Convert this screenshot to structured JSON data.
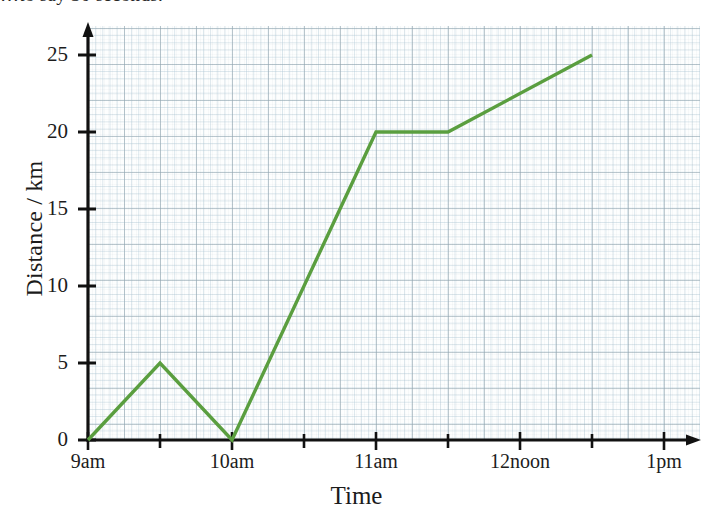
{
  "top_text": "…to say 30 seconds.",
  "chart_data": {
    "type": "line",
    "title": "",
    "xlabel": "Time",
    "ylabel": "Distance / km",
    "grid": true,
    "legend": "none",
    "line_color": "#5a9e3f",
    "axis_color": "#111111",
    "x_tick_labels": [
      "9am",
      "10am",
      "11am",
      "12noon",
      "1pm"
    ],
    "x_tick_values": [
      9,
      10,
      11,
      12,
      13
    ],
    "x_minor_tick_values": [
      9.5,
      10.5,
      11.5,
      12.5
    ],
    "xlim": [
      9,
      13
    ],
    "y_tick_labels": [
      "0",
      "5",
      "10",
      "15",
      "20",
      "25"
    ],
    "y_tick_values": [
      0,
      5,
      10,
      15,
      20,
      25
    ],
    "ylim": [
      0,
      27
    ],
    "series": [
      {
        "name": "journey",
        "points": [
          {
            "x": 9.0,
            "y": 0,
            "x_label": "9am",
            "y_label": "0"
          },
          {
            "x": 9.5,
            "y": 5,
            "x_label": "9:30am",
            "y_label": "5"
          },
          {
            "x": 10.0,
            "y": 0,
            "x_label": "10am",
            "y_label": "0"
          },
          {
            "x": 11.0,
            "y": 20,
            "x_label": "11am",
            "y_label": "20"
          },
          {
            "x": 11.5,
            "y": 20,
            "x_label": "11:30am",
            "y_label": "20"
          },
          {
            "x": 12.5,
            "y": 25,
            "x_label": "12:30pm",
            "y_label": "25"
          }
        ]
      }
    ]
  }
}
